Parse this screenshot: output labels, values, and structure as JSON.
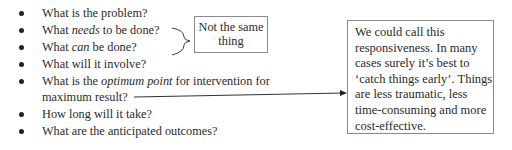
{
  "bullet_list": {
    "items": [
      {
        "pre": "What is the problem?",
        "em": "",
        "post": ""
      },
      {
        "pre": "What ",
        "em": "needs",
        "post": " to be done?"
      },
      {
        "pre": "What ",
        "em": "can",
        "post": " be done?"
      },
      {
        "pre": "What will it involve?",
        "em": "",
        "post": ""
      },
      {
        "pre": "What is the ",
        "em": "optimum point",
        "post": " for intervention for",
        "line2": "maximum result?"
      },
      {
        "pre": "How long will it take?",
        "em": "",
        "post": ""
      },
      {
        "pre": "What are the anticipated outcomes?",
        "em": "",
        "post": ""
      }
    ]
  },
  "callout_small": {
    "line1": "Not the same",
    "line2": "thing"
  },
  "callout_large": {
    "lines": [
      "We could call this",
      "responsiveness.  In many",
      "cases surely it’s best to",
      "‘catch things early’. Things",
      "are less traumatic, less",
      "time-consuming and more",
      "cost-effective."
    ]
  }
}
